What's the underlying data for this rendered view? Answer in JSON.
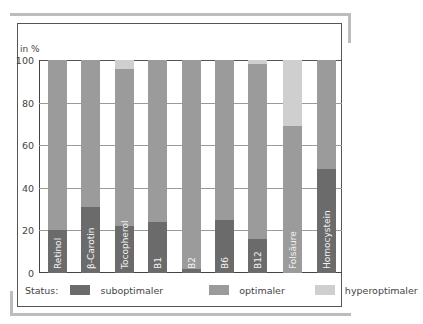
{
  "chart_data": {
    "type": "bar",
    "stacked": true,
    "title": "",
    "xlabel": "",
    "ylabel": "in %",
    "ylim": [
      0,
      100
    ],
    "yticks": [
      0,
      20,
      40,
      60,
      80,
      100
    ],
    "grid": true,
    "categories": [
      "Retinol",
      "β-Carotin",
      "Tocopherol",
      "B1",
      "B2",
      "B6",
      "B12",
      "Folsäure",
      "Homocystein"
    ],
    "series": [
      {
        "name": "suboptimaler",
        "color": "#6b6b6b",
        "values": [
          20,
          31,
          22,
          24,
          2,
          25,
          16,
          0,
          49
        ]
      },
      {
        "name": "optimaler",
        "color": "#9b9b9b",
        "values": [
          80,
          69,
          74,
          76,
          98,
          75,
          82,
          69,
          51
        ]
      },
      {
        "name": "hyperoptimaler",
        "color": "#cfcfcf",
        "values": [
          0,
          0,
          4,
          0,
          0,
          0,
          2,
          31,
          0
        ]
      }
    ],
    "legend": {
      "position": "bottom",
      "title": "Status:"
    }
  },
  "axis": {
    "unit_label": "in %",
    "ticks": [
      "0",
      "20",
      "40",
      "60",
      "80",
      "100"
    ]
  },
  "legend": {
    "title": "Status:",
    "items": [
      {
        "label": "suboptimaler",
        "color": "#6b6b6b"
      },
      {
        "label": "optimaler",
        "color": "#9b9b9b"
      },
      {
        "label": "hyperoptimaler",
        "color": "#cfcfcf"
      }
    ]
  }
}
